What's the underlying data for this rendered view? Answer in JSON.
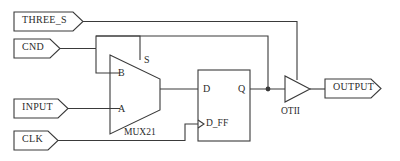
{
  "diagram": {
    "line_color": "#3a3a3a",
    "text_color": "#2b2b2b",
    "background": "#ffffff"
  },
  "ports": {
    "inputs": [
      {
        "name": "three-s",
        "label": "THREE_S"
      },
      {
        "name": "cnd",
        "label": "CND"
      },
      {
        "name": "input",
        "label": "INPUT"
      },
      {
        "name": "clk",
        "label": "CLK"
      }
    ],
    "outputs": [
      {
        "name": "output",
        "label": "OUTPUT"
      }
    ]
  },
  "blocks": {
    "mux": {
      "label": "MUX21",
      "pins": {
        "sel": "S",
        "b": "B",
        "a": "A"
      }
    },
    "dff": {
      "label": "D_FF",
      "pins": {
        "d": "D",
        "q": "Q"
      }
    },
    "buffer": {
      "label": "OTII"
    }
  }
}
